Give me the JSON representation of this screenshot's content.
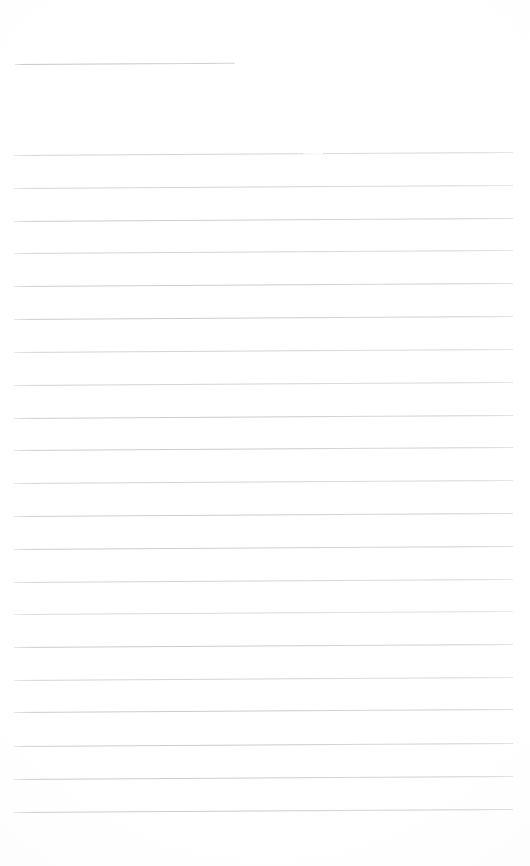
{
  "document": {
    "type": "scanned-lined-paper",
    "title": "Blank Ruled Notepaper Scan",
    "page_width": 530,
    "page_height": 866,
    "background_color": "#ffffff",
    "rule_color": "#c9ccd2",
    "content_text": "",
    "notes_written": "none"
  },
  "header_rule": {
    "name": "short header rule",
    "x": 15,
    "y": 64,
    "width": 220,
    "tilt_deg": -0.35,
    "color": "#c4c7cd"
  },
  "rules": [
    {
      "y": 155,
      "x": 14,
      "width": 499,
      "tilt_deg": -0.35,
      "color": "#c9ccd2",
      "weight": "faint",
      "gap": true
    },
    {
      "y": 188,
      "x": 14,
      "width": 499,
      "tilt_deg": -0.35,
      "color": "#c9ccd2",
      "weight": "faint",
      "gap": false
    },
    {
      "y": 221,
      "x": 14,
      "width": 499,
      "tilt_deg": -0.35,
      "color": "#c9ccd2",
      "weight": "normal",
      "gap": false
    },
    {
      "y": 253,
      "x": 14,
      "width": 499,
      "tilt_deg": -0.35,
      "color": "#c9ccd2",
      "weight": "faint",
      "gap": false
    },
    {
      "y": 286,
      "x": 14,
      "width": 499,
      "tilt_deg": -0.35,
      "color": "#c9ccd2",
      "weight": "normal",
      "gap": false
    },
    {
      "y": 319,
      "x": 14,
      "width": 499,
      "tilt_deg": -0.35,
      "color": "#c9ccd2",
      "weight": "normal",
      "gap": false
    },
    {
      "y": 352,
      "x": 14,
      "width": 499,
      "tilt_deg": -0.35,
      "color": "#c9ccd2",
      "weight": "faint",
      "gap": false
    },
    {
      "y": 385,
      "x": 14,
      "width": 499,
      "tilt_deg": -0.35,
      "color": "#c9ccd2",
      "weight": "faint",
      "gap": false
    },
    {
      "y": 418,
      "x": 14,
      "width": 499,
      "tilt_deg": -0.35,
      "color": "#c9ccd2",
      "weight": "normal",
      "gap": false
    },
    {
      "y": 450,
      "x": 14,
      "width": 499,
      "tilt_deg": -0.35,
      "color": "#c9ccd2",
      "weight": "normal",
      "gap": false
    },
    {
      "y": 483,
      "x": 14,
      "width": 499,
      "tilt_deg": -0.35,
      "color": "#c9ccd2",
      "weight": "faint",
      "gap": false
    },
    {
      "y": 516,
      "x": 14,
      "width": 499,
      "tilt_deg": -0.35,
      "color": "#c9ccd2",
      "weight": "normal",
      "gap": false
    },
    {
      "y": 549,
      "x": 14,
      "width": 499,
      "tilt_deg": -0.35,
      "color": "#c9ccd2",
      "weight": "normal",
      "gap": false
    },
    {
      "y": 582,
      "x": 14,
      "width": 499,
      "tilt_deg": -0.35,
      "color": "#c9ccd2",
      "weight": "faint",
      "gap": false
    },
    {
      "y": 614,
      "x": 14,
      "width": 499,
      "tilt_deg": -0.35,
      "color": "#c9ccd2",
      "weight": "very-faint",
      "gap": false
    },
    {
      "y": 647,
      "x": 14,
      "width": 499,
      "tilt_deg": -0.35,
      "color": "#c9ccd2",
      "weight": "normal",
      "gap": false
    },
    {
      "y": 680,
      "x": 14,
      "width": 499,
      "tilt_deg": -0.35,
      "color": "#c9ccd2",
      "weight": "faint",
      "gap": false
    },
    {
      "y": 712,
      "x": 14,
      "width": 499,
      "tilt_deg": -0.35,
      "color": "#c9ccd2",
      "weight": "normal",
      "gap": false
    },
    {
      "y": 746,
      "x": 14,
      "width": 499,
      "tilt_deg": -0.35,
      "color": "#c9ccd2",
      "weight": "normal",
      "gap": false
    },
    {
      "y": 779,
      "x": 14,
      "width": 499,
      "tilt_deg": -0.35,
      "color": "#c9ccd2",
      "weight": "normal",
      "gap": false
    },
    {
      "y": 812,
      "x": 14,
      "width": 499,
      "tilt_deg": -0.35,
      "color": "#c9ccd2",
      "weight": "normal",
      "gap": false
    }
  ]
}
